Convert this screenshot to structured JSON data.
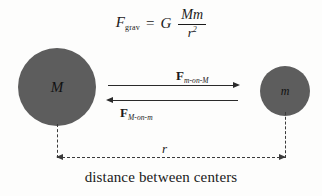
{
  "figure": {
    "background_color": "#fdfdfc",
    "ink_color": "#1a1a1a",
    "body_fill_color": "#5d5d5d"
  },
  "equation": {
    "lhs_symbol": "F",
    "lhs_subscript": "grav",
    "equals": "=",
    "constant": "G",
    "numerator": "Mm",
    "denominator_base": "r",
    "denominator_exponent": "2",
    "plain_text": "F_grav = G Mm / r^2"
  },
  "bodies": {
    "large": {
      "label": "M",
      "name": "large-mass",
      "diameter_px": 78,
      "center_x_px": 57,
      "center_y_px": 87
    },
    "small": {
      "label": "m",
      "name": "small-mass",
      "diameter_px": 50,
      "center_x_px": 285,
      "center_y_px": 91
    }
  },
  "forces": [
    {
      "symbol": "F",
      "subscript": "m-on-M",
      "direction": "right",
      "plain_text": "F_m-on-M"
    },
    {
      "symbol": "F",
      "subscript": "M-on-m",
      "direction": "left",
      "plain_text": "F_M-on-m"
    }
  ],
  "distance": {
    "symbol": "r",
    "caption": "distance between centers"
  }
}
